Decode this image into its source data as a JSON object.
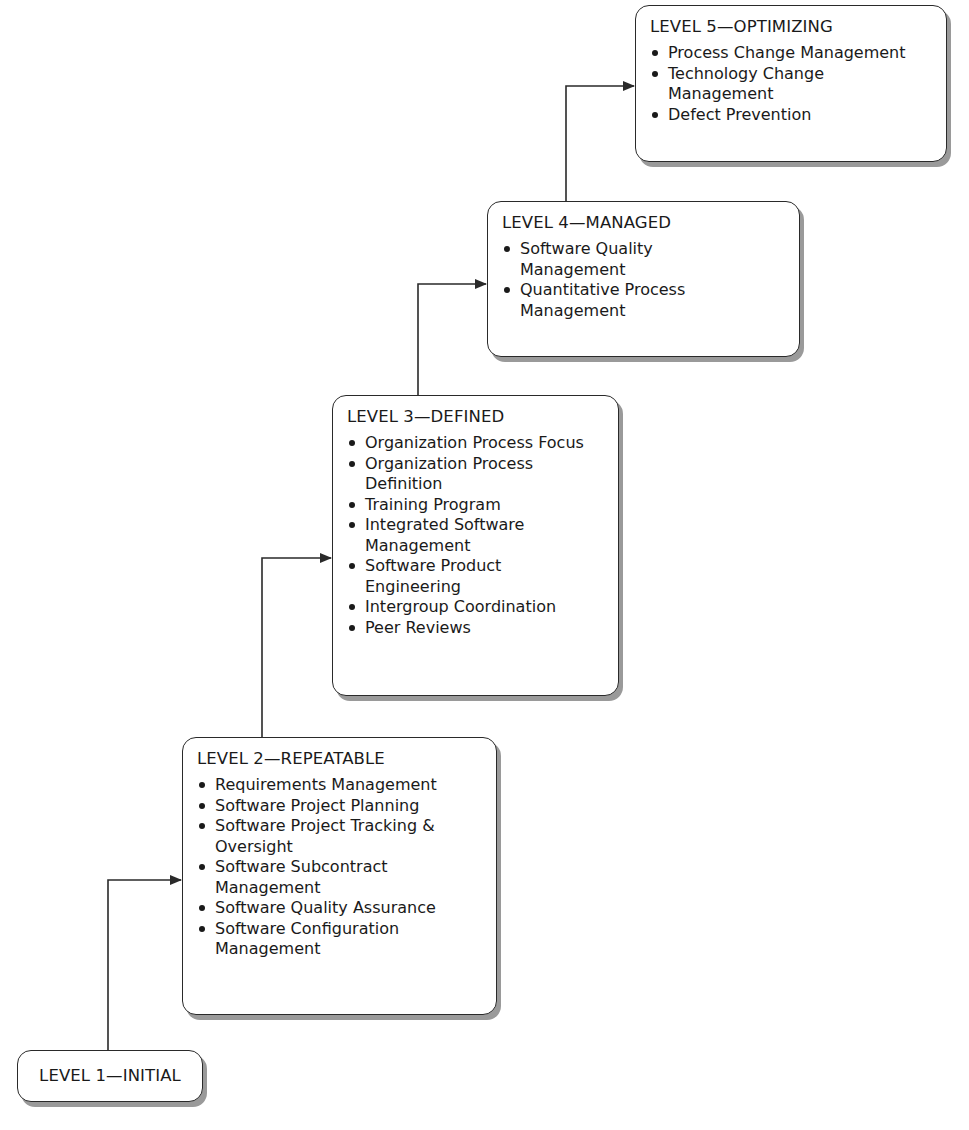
{
  "diagram": {
    "type": "staircase",
    "levels": [
      {
        "id": "level-1",
        "title": "LEVEL 1—INITIAL",
        "items": []
      },
      {
        "id": "level-2",
        "title": "LEVEL 2—REPEATABLE",
        "items": [
          "Requirements Management",
          "Software Project Planning",
          "Software Project Tracking & Oversight",
          "Software Subcontract Management",
          "Software Quality Assurance",
          "Software Configuration Management"
        ]
      },
      {
        "id": "level-3",
        "title": "LEVEL 3—DEFINED",
        "items": [
          "Organization Process Focus",
          "Organization Process Definition",
          "Training Program",
          "Integrated Software Management",
          "Software Product Engineering",
          "Intergroup Coordination",
          "Peer Reviews"
        ]
      },
      {
        "id": "level-4",
        "title": "LEVEL 4—MANAGED",
        "items": [
          "Software Quality Management",
          "Quantitative Process Management"
        ]
      },
      {
        "id": "level-5",
        "title": "LEVEL 5—OPTIMIZING",
        "items": [
          "Process Change Management",
          "Technology Change Management",
          "Defect Prevention"
        ]
      }
    ],
    "edges": [
      {
        "from": "level-1",
        "to": "level-2"
      },
      {
        "from": "level-2",
        "to": "level-3"
      },
      {
        "from": "level-3",
        "to": "level-4"
      },
      {
        "from": "level-4",
        "to": "level-5"
      }
    ],
    "colors": {
      "line": "#2a2a2a",
      "shadow": "#9a9a9a",
      "box_fill": "#ffffff"
    }
  }
}
